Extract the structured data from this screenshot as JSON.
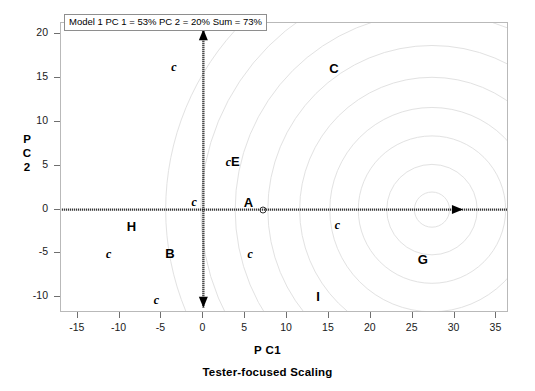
{
  "chart_data": {
    "type": "scatter",
    "title": "Model 1 PC 1 = 53% PC 2 = 20% Sum = 73%",
    "xlabel": "P C1",
    "xsublabel": "Tester-focused Scaling",
    "ylabel_lines": [
      "P",
      "C",
      "2"
    ],
    "xlim": [
      -17.0,
      36.5
    ],
    "ylim": [
      -11.8,
      21.3
    ],
    "xticks": [
      -15,
      -10,
      -5,
      0,
      5,
      10,
      15,
      20,
      25,
      30,
      35
    ],
    "yticks": [
      20,
      15,
      10,
      5,
      0,
      -5,
      -10
    ],
    "grid": false,
    "legend_position": "none",
    "axis_arrows": {
      "vertical": {
        "x": 0,
        "y_from": -11.2,
        "y_to": 20.6,
        "double_headed": true,
        "style": "dotted-thick"
      },
      "horizontal": {
        "y": 0,
        "x_from": -16.9,
        "x_to": 36.4,
        "arrowhead_at_x": 31.0,
        "style": "dotted-thick"
      }
    },
    "contours": {
      "description": "concentric light-gray circular arcs centered on the PC1 axis",
      "center": [
        27.3,
        0.0
      ],
      "radii": [
        2.1,
        5.4,
        8.8,
        12.2,
        15.8,
        19.6,
        23.5,
        27.6,
        31.8
      ],
      "color": "#e2e2e2"
    },
    "marker_points": [
      {
        "label": "c",
        "type": "minor",
        "x": -11.3,
        "y": -5.1
      },
      {
        "label": "c",
        "type": "minor",
        "x": -5.6,
        "y": -10.3
      },
      {
        "label": "c",
        "type": "minor",
        "x": -3.5,
        "y": 16.3
      },
      {
        "label": "c",
        "type": "minor",
        "x": -1.1,
        "y": 0.9
      },
      {
        "label": "c",
        "type": "minor",
        "x": 5.6,
        "y": -5.1
      },
      {
        "label": "c",
        "type": "minor",
        "x": 16.0,
        "y": -1.7
      },
      {
        "label": "cE",
        "type": "combo",
        "x": 3.5,
        "y": 5.4
      },
      {
        "label": "A",
        "type": "major",
        "x": 5.4,
        "y": 0.9
      },
      {
        "label": "B",
        "type": "major",
        "x": -4.0,
        "y": -5.0
      },
      {
        "label": "C",
        "type": "major",
        "x": 15.6,
        "y": 16.2
      },
      {
        "label": "G",
        "type": "major",
        "x": 26.2,
        "y": -5.6
      },
      {
        "label": "H",
        "type": "major",
        "x": -8.6,
        "y": -1.9
      },
      {
        "label": "I",
        "type": "major",
        "x": 13.7,
        "y": -9.9
      }
    ],
    "origin_marker": {
      "x": 7.1,
      "y": 0.0,
      "shape": "open-circle"
    }
  },
  "colors": {
    "frame": "#b9b9b9",
    "axis": "#000000",
    "contour": "#e2e2e2",
    "text": "#000000",
    "tick": "#6f6f6f"
  }
}
